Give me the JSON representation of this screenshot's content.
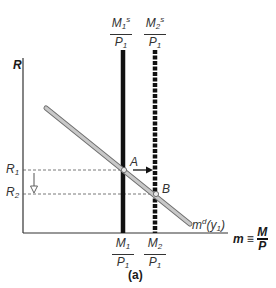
{
  "diagram": {
    "panel_label": "(a)",
    "y_axis": {
      "label": "R"
    },
    "x_axis": {
      "label": "m",
      "equiv": "≡",
      "fraction": {
        "num": "M",
        "den": "P"
      }
    },
    "supply_curves": [
      {
        "id": "ms1",
        "top_num": "M",
        "top_num_sub": "1",
        "top_num_sup": "s",
        "top_den": "P",
        "top_den_sub": "1",
        "bottom_num": "M",
        "bottom_num_sub": "1",
        "bottom_den": "P",
        "bottom_den_sub": "1",
        "style": "solid"
      },
      {
        "id": "ms2",
        "top_num": "M",
        "top_num_sub": "2",
        "top_num_sup": "s",
        "top_den": "P",
        "top_den_sub": "1",
        "bottom_num": "M",
        "bottom_num_sub": "2",
        "bottom_den": "P",
        "bottom_den_sub": "1",
        "style": "dashed"
      }
    ],
    "demand_curve": {
      "label": "m",
      "sup": "d",
      "arg": "(y",
      "arg_sub": "1",
      "arg_close": ")"
    },
    "rates": [
      {
        "label": "R",
        "sub": "1"
      },
      {
        "label": "R",
        "sub": "2"
      }
    ],
    "points": [
      {
        "label": "A"
      },
      {
        "label": "B"
      }
    ],
    "colors": {
      "axis": "#333333",
      "supply": "#111111",
      "demand_fill": "#c8c8c8",
      "demand_edge": "#6e6e6e",
      "guide": "#555555"
    }
  }
}
